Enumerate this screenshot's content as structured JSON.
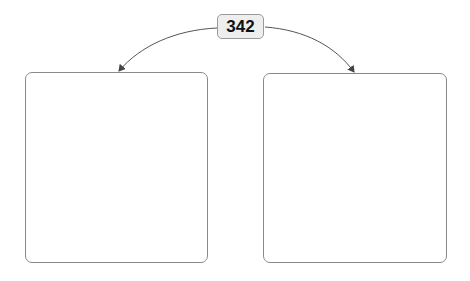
{
  "diagram": {
    "root": {
      "label": "342"
    },
    "children": [
      {
        "id": "left",
        "label": ""
      },
      {
        "id": "right",
        "label": ""
      }
    ],
    "colors": {
      "line": "#555555",
      "box_border": "#8a8a8a",
      "label_fill": "#eeeeee",
      "label_border": "#9a9a9a"
    }
  }
}
